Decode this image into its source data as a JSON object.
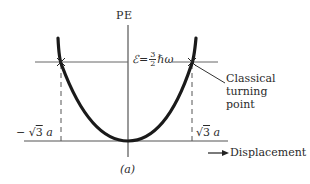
{
  "figure": {
    "axis_label_y": "PE",
    "energy_label": {
      "symbol": "ℰ",
      "equals": " = ",
      "numerator": "3",
      "denominator": "2",
      "rest": "ℏω"
    },
    "annotation": {
      "line1": "Classical",
      "line2": "turning",
      "line3": "point"
    },
    "left_turning_label": "−√3 a",
    "left_turning_prefix": "− √",
    "left_turning_rad": "3",
    "left_turning_suffix": " a",
    "right_turning_prefix": "√",
    "right_turning_rad": "3",
    "right_turning_suffix": " a",
    "x_axis_label": "Displacement",
    "x_axis_var": "x",
    "caption": "(a)"
  },
  "colors": {
    "curve": "#1a1a1a",
    "axes": "#555555",
    "background": "#ffffff"
  }
}
